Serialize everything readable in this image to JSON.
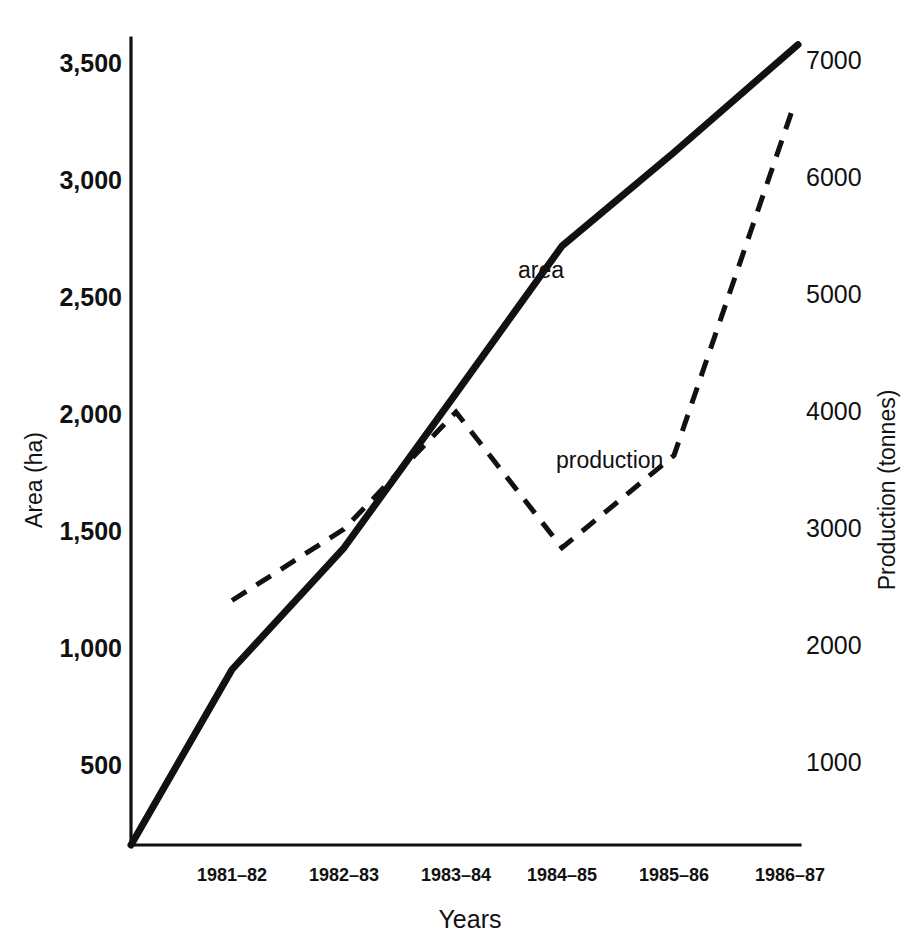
{
  "chart_data": {
    "type": "line",
    "title": "",
    "xlabel": "Years",
    "categories": [
      "1981–82",
      "1982–83",
      "1983–84",
      "1984–85",
      "1985–86",
      "1986–87"
    ],
    "grid": false,
    "legend_position": "inline-annotation",
    "axes": {
      "left": {
        "label": "Area  (ha)",
        "ticks": [
          "3,500",
          "3,000",
          "2,500",
          "2,000",
          "1,500",
          "1,000",
          "500"
        ],
        "tick_values": [
          3500,
          3000,
          2500,
          2000,
          1500,
          1000,
          500
        ],
        "ylim": [
          0,
          3500
        ],
        "units": "ha"
      },
      "right": {
        "label": "Production  (tonnes)",
        "ticks": [
          "7000",
          "6000",
          "5000",
          "4000",
          "3000",
          "2000",
          "1000"
        ],
        "tick_values": [
          7000,
          6000,
          5000,
          4000,
          3000,
          2000,
          1000
        ],
        "ylim": [
          0,
          7000
        ],
        "units": "tonnes"
      }
    },
    "series": [
      {
        "name": "area",
        "annotation": "area",
        "axis": "left",
        "style": "solid",
        "values": [
          750,
          1270,
          1930,
          2560,
          2960,
          3420
        ],
        "origin_value": 0
      },
      {
        "name": "production",
        "annotation": "production",
        "axis": "right",
        "style": "dashed",
        "values": [
          2090,
          2700,
          3700,
          2540,
          3330,
          6350
        ]
      }
    ]
  },
  "annotations": {
    "area_label": "area",
    "production_label": "production"
  },
  "colors": {
    "ink": "#111111",
    "background": "#ffffff"
  }
}
